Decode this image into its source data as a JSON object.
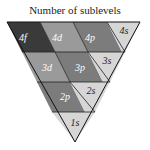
{
  "title": "Number of sublevels",
  "colors": {
    "f": "#3a3a3a",
    "d": "#9a9a9a",
    "p": "#7c7c7c",
    "s": "#d6d6d6",
    "edge": "#111111"
  },
  "cells": [
    {
      "label": "4f",
      "type": "f"
    },
    {
      "label": "4d",
      "type": "d"
    },
    {
      "label": "4p",
      "type": "p"
    },
    {
      "label": "4s",
      "type": "s"
    },
    {
      "label": "3d",
      "type": "d"
    },
    {
      "label": "3p",
      "type": "p"
    },
    {
      "label": "3s",
      "type": "s"
    },
    {
      "label": "2p",
      "type": "p"
    },
    {
      "label": "2s",
      "type": "s"
    },
    {
      "label": "1s",
      "type": "s"
    }
  ]
}
